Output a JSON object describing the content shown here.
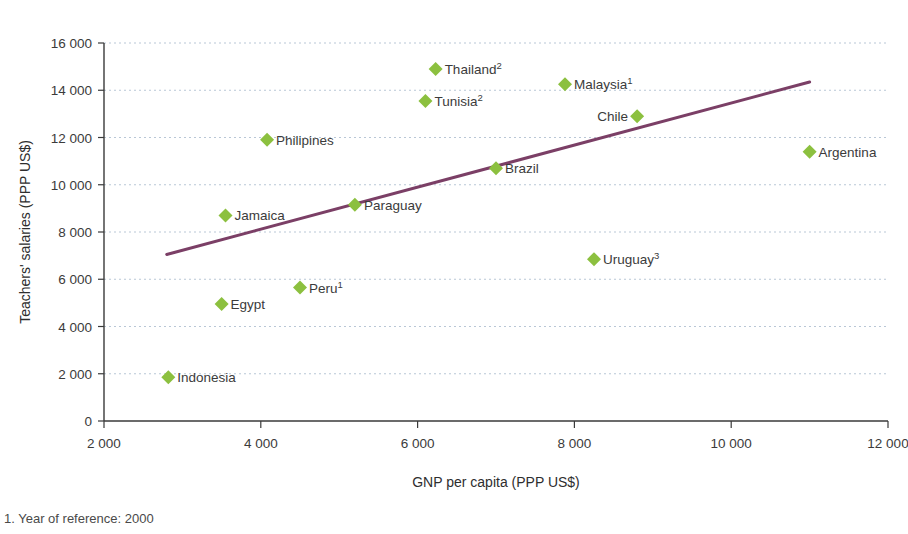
{
  "chart_data": {
    "type": "scatter",
    "title": "",
    "xlabel": "GNP per capita (PPP US$)",
    "ylabel": "Teachers' salaries (PPP US$)",
    "xlim": [
      2000,
      12000
    ],
    "ylim": [
      0,
      16000
    ],
    "grid": true,
    "legend": false,
    "x_ticks": [
      2000,
      4000,
      6000,
      8000,
      10000,
      12000
    ],
    "x_tick_labels": [
      "2 000",
      "4 000",
      "6 000",
      "8 000",
      "10 000",
      "12 000"
    ],
    "y_ticks": [
      0,
      2000,
      4000,
      6000,
      8000,
      10000,
      12000,
      14000,
      16000
    ],
    "y_tick_labels": [
      "0",
      "2 000",
      "4 000",
      "6 000",
      "8 000",
      "10 000",
      "12 000",
      "14 000",
      "16 000"
    ],
    "marker_color": "#8cc03f",
    "marker_shape": "diamond",
    "trend_line": {
      "color": "#7b3f66",
      "x_start": 2800,
      "y_start": 7050,
      "x_end": 11000,
      "y_end": 14350
    },
    "points": [
      {
        "label": "Indonesia",
        "sup": "",
        "x": 2820,
        "y": 1850,
        "label_side": "right"
      },
      {
        "label": "Egypt",
        "sup": "",
        "x": 3500,
        "y": 4950,
        "label_side": "right"
      },
      {
        "label": "Jamaica",
        "sup": "",
        "x": 3550,
        "y": 8700,
        "label_side": "right"
      },
      {
        "label": "Philipines",
        "sup": "",
        "x": 4080,
        "y": 11900,
        "label_side": "right"
      },
      {
        "label": "Peru",
        "sup": "1",
        "x": 4500,
        "y": 5650,
        "label_side": "right"
      },
      {
        "label": "Paraguay",
        "sup": "",
        "x": 5200,
        "y": 9150,
        "label_side": "right"
      },
      {
        "label": "Tunisia",
        "sup": "2",
        "x": 6100,
        "y": 13550,
        "label_side": "right"
      },
      {
        "label": "Thailand",
        "sup": "2",
        "x": 6230,
        "y": 14900,
        "label_side": "right"
      },
      {
        "label": "Brazil",
        "sup": "",
        "x": 7000,
        "y": 10700,
        "label_side": "right"
      },
      {
        "label": "Malaysia",
        "sup": "1",
        "x": 7880,
        "y": 14250,
        "label_side": "right"
      },
      {
        "label": "Uruguay",
        "sup": "3",
        "x": 8250,
        "y": 6850,
        "label_side": "right"
      },
      {
        "label": "Chile",
        "sup": "",
        "x": 8800,
        "y": 12900,
        "label_side": "left"
      },
      {
        "label": "Argentina",
        "sup": "",
        "x": 11000,
        "y": 11400,
        "label_side": "right"
      }
    ]
  },
  "footnote": {
    "text": "1. Year of reference: 2000"
  }
}
